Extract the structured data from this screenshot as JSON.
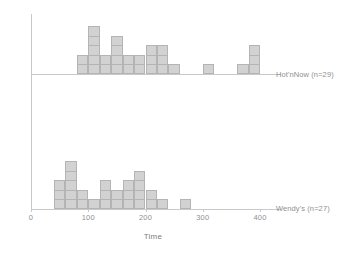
{
  "chart_data": {
    "type": "bar",
    "title": "",
    "xlabel": "Time",
    "ylabel": "",
    "xlim": [
      0,
      440
    ],
    "ylim": [
      0,
      6
    ],
    "grid": false,
    "legend_position": "right",
    "bin_width": 20,
    "unit": "one square = one observation",
    "xticks": [
      0,
      100,
      200,
      300,
      400
    ],
    "xticklabels": [
      "0",
      "100",
      "200",
      "300",
      "400"
    ],
    "series": [
      {
        "name": "Hot'nNow (n=29)",
        "label": "Hot'nNow (n=29)",
        "count": 29,
        "panel": "top",
        "bin_start": 80,
        "categories": [
          "80-100",
          "100-120",
          "120-140",
          "140-160",
          "160-180",
          "180-200",
          "200-220",
          "220-240",
          "240-260",
          "260-280",
          "280-300",
          "300-320",
          "320-340",
          "340-360",
          "360-380",
          "380-400"
        ],
        "values": [
          2,
          5,
          2,
          4,
          2,
          2,
          3,
          3,
          1,
          0,
          0,
          1,
          0,
          0,
          1,
          3
        ]
      },
      {
        "name": "Wendy's (n=27)",
        "label": "Wendy's (n=27)",
        "count": 27,
        "panel": "bottom",
        "bin_start": 40,
        "categories": [
          "40-60",
          "60-80",
          "80-100",
          "100-120",
          "120-140",
          "140-160",
          "160-180",
          "180-200",
          "200-220",
          "220-240",
          "240-260",
          "260-280"
        ],
        "values": [
          3,
          5,
          2,
          1,
          3,
          2,
          3,
          4,
          2,
          1,
          0,
          1
        ]
      }
    ],
    "colors": {
      "bar_fill": "#d2d2d2",
      "bar_stroke": "#b4b4b4",
      "axis": "#c9c9c9",
      "text": "#8f8f8f"
    }
  }
}
